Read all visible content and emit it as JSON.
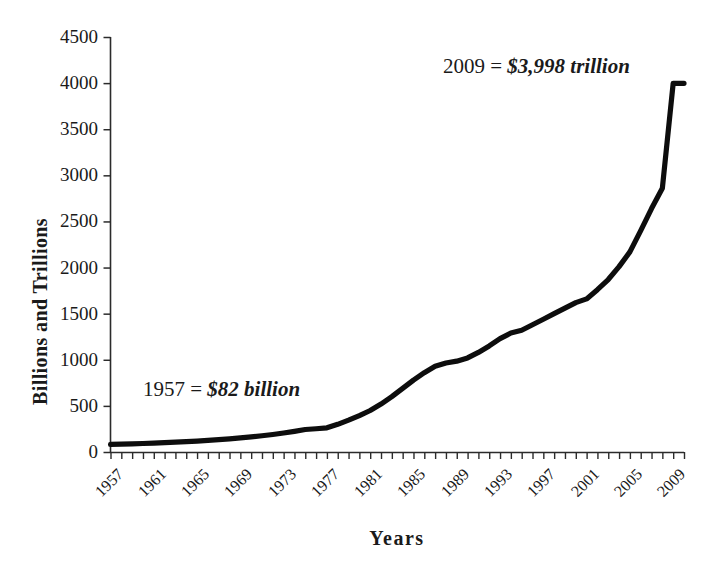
{
  "chart_data": {
    "type": "line",
    "title": "",
    "subtitle": "",
    "xlabel": "Years",
    "ylabel": "Billions and Trillions",
    "xlim": [
      1957,
      2010
    ],
    "ylim": [
      0,
      4500
    ],
    "grid": false,
    "legend": "none",
    "line_color": "#000000",
    "line_width": 5,
    "background_color": "#ffffff",
    "y_ticks": [
      0,
      500,
      1000,
      1500,
      2000,
      2500,
      3000,
      3500,
      4000,
      4500
    ],
    "y_tick_labels": [
      "0",
      "500",
      "1000",
      "1500",
      "2000",
      "2500",
      "3000",
      "3500",
      "4000",
      "4500"
    ],
    "x_tick_labels": [
      "1957",
      "1961",
      "1965",
      "1969",
      "1973",
      "1977",
      "1981",
      "1985",
      "1989",
      "1993",
      "1997",
      "2001",
      "2005",
      "2009"
    ],
    "x_minor_tick_step": 1,
    "x": [
      1957,
      1958,
      1959,
      1960,
      1961,
      1962,
      1963,
      1964,
      1965,
      1966,
      1967,
      1968,
      1969,
      1970,
      1971,
      1972,
      1973,
      1974,
      1975,
      1976,
      1977,
      1978,
      1979,
      1980,
      1981,
      1982,
      1983,
      1984,
      1985,
      1986,
      1987,
      1988,
      1989,
      1990,
      1991,
      1992,
      1993,
      1994,
      1995,
      1996,
      1997,
      1998,
      1999,
      2000,
      2001,
      2002,
      2003,
      2004,
      2005,
      2006,
      2007,
      2008,
      2009,
      2010
    ],
    "values": [
      82,
      85,
      88,
      92,
      96,
      101,
      106,
      112,
      119,
      126,
      134,
      143,
      153,
      164,
      176,
      190,
      206,
      224,
      244,
      252,
      262,
      300,
      345,
      395,
      450,
      520,
      600,
      690,
      780,
      860,
      930,
      965,
      985,
      1020,
      1080,
      1150,
      1230,
      1290,
      1320,
      1380,
      1440,
      1500,
      1560,
      1620,
      1660,
      1760,
      1870,
      2010,
      2170,
      2400,
      2640,
      2860,
      3998,
      3998
    ],
    "series": [
      {
        "name": "Money supply",
        "values": [
          82,
          85,
          88,
          92,
          96,
          101,
          106,
          112,
          119,
          126,
          134,
          143,
          153,
          164,
          176,
          190,
          206,
          224,
          244,
          252,
          262,
          300,
          345,
          395,
          450,
          520,
          600,
          690,
          780,
          860,
          930,
          965,
          985,
          1020,
          1080,
          1150,
          1230,
          1290,
          1320,
          1380,
          1440,
          1500,
          1560,
          1620,
          1660,
          1760,
          1870,
          2010,
          2170,
          2400,
          2640,
          2860,
          3998,
          3998
        ]
      }
    ],
    "annotations": [
      {
        "id": "start",
        "lead": "1957 = ",
        "value": "$82 billion",
        "full_text": "1957 = $82 billion",
        "x_value": 1957,
        "y_value": 82
      },
      {
        "id": "end",
        "lead": "2009 = ",
        "value": "$3,998 trillion",
        "full_text": "2009 = $3,998 trillion",
        "x_value": 2009,
        "y_value": 3998
      }
    ]
  }
}
